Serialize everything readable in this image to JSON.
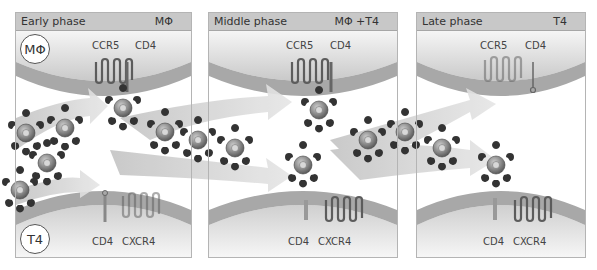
{
  "figure": {
    "panels": [
      {
        "phase": "Early phase",
        "cell_type": "MΦ"
      },
      {
        "phase": "Middle phase",
        "cell_type": "MΦ +T4"
      },
      {
        "phase": "Late phase",
        "cell_type": "T4"
      }
    ],
    "top_cell": {
      "badge": "MΦ",
      "receptor_labels": [
        "CCR5",
        "CD4"
      ]
    },
    "bottom_cell": {
      "badge": "T4",
      "receptor_labels": [
        "CD4",
        "CXCR4"
      ]
    },
    "colors": {
      "header_bg": "#c8c8c8",
      "membrane": "#9e9e9e",
      "arrow": "#d2d2d2",
      "virus": "#7a7a7a",
      "receptor": "#666666"
    }
  }
}
